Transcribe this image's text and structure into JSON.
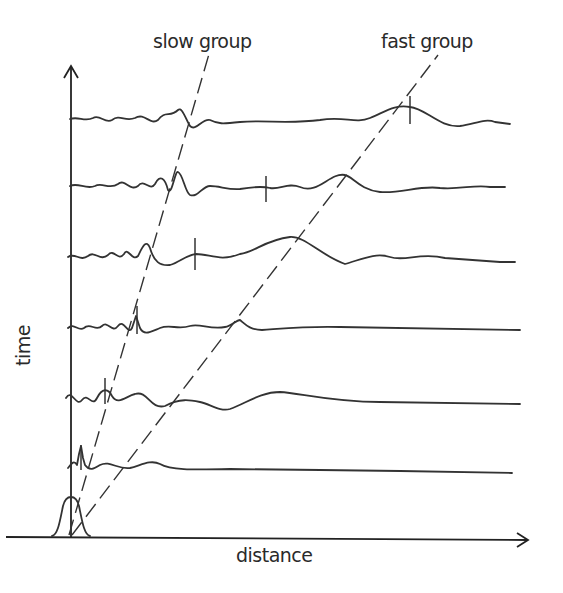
{
  "diagram": {
    "title": "",
    "labels": {
      "slow_group": "slow group",
      "fast_group": "fast group",
      "y_axis": "time",
      "x_axis": "distance"
    },
    "colors": {
      "ink": "#333333",
      "background": "#ffffff"
    },
    "traces": [
      {
        "row": 1,
        "baseline_y": 119,
        "note": "top trace, latest time"
      },
      {
        "row": 2,
        "baseline_y": 186
      },
      {
        "row": 3,
        "baseline_y": 257
      },
      {
        "row": 4,
        "baseline_y": 328
      },
      {
        "row": 5,
        "baseline_y": 398
      },
      {
        "row": 6,
        "baseline_y": 468
      },
      {
        "row": 7,
        "baseline_y": 537,
        "note": "initial Gaussian pulse at origin"
      }
    ]
  }
}
